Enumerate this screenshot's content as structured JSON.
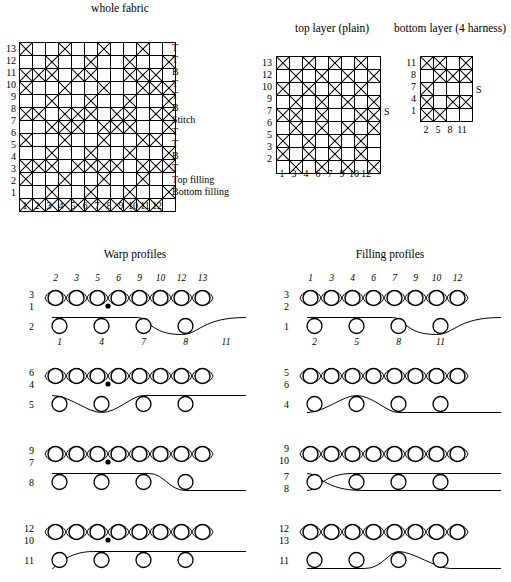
{
  "titles": {
    "whole_fabric": "whole fabric",
    "top_layer": "top layer (plain)",
    "bottom_layer": "bottom layer (4 harness)",
    "warp_profiles": "Warp profiles",
    "filling_profiles": "Filling profiles"
  },
  "whole_fabric": {
    "row_labels": [
      "13",
      "12",
      "11",
      "10",
      "9",
      "8",
      "7",
      "6",
      "5",
      "4",
      "3",
      "2",
      "1"
    ],
    "col_labels": [
      "1",
      "2",
      "3",
      "4",
      "5",
      "6",
      "7",
      "8",
      "9",
      "10",
      "11",
      "12"
    ],
    "side_codes": [
      "T",
      "T",
      "B",
      "T",
      "T",
      "B",
      "Stitch",
      "T",
      "T",
      "B",
      "T",
      "Top filling",
      "Bottom filling"
    ],
    "rows": [
      [
        1,
        0,
        0,
        1,
        0,
        0,
        1,
        0,
        0,
        1,
        0,
        0
      ],
      [
        0,
        0,
        1,
        0,
        0,
        1,
        0,
        0,
        1,
        0,
        0,
        1
      ],
      [
        1,
        1,
        1,
        0,
        1,
        1,
        0,
        0,
        1,
        1,
        1,
        0
      ],
      [
        1,
        0,
        0,
        1,
        0,
        0,
        1,
        0,
        0,
        1,
        1,
        1
      ],
      [
        0,
        0,
        1,
        0,
        0,
        1,
        0,
        0,
        1,
        0,
        0,
        1
      ],
      [
        1,
        1,
        0,
        1,
        1,
        1,
        0,
        1,
        1,
        0,
        1,
        1
      ],
      [
        0,
        0,
        1,
        1,
        1,
        0,
        1,
        1,
        1,
        0,
        0,
        1
      ],
      [
        1,
        0,
        0,
        1,
        0,
        0,
        1,
        0,
        0,
        1,
        1,
        0
      ],
      [
        0,
        0,
        1,
        0,
        0,
        1,
        0,
        0,
        1,
        0,
        0,
        1
      ],
      [
        1,
        1,
        1,
        0,
        1,
        1,
        1,
        1,
        0,
        1,
        1,
        1
      ],
      [
        1,
        0,
        0,
        1,
        0,
        0,
        1,
        0,
        0,
        1,
        0,
        0
      ],
      [
        0,
        0,
        1,
        0,
        0,
        1,
        0,
        0,
        1,
        0,
        0,
        1
      ],
      [
        1,
        1,
        1,
        1,
        1,
        1,
        1,
        1,
        1,
        1,
        1,
        0
      ]
    ]
  },
  "top_layer": {
    "row_labels": [
      "13",
      "12",
      "10",
      "9",
      "7",
      "6",
      "5",
      "3",
      "2"
    ],
    "col_labels": [
      "1",
      "3",
      "4",
      "6",
      "7",
      "9",
      "10",
      "12"
    ],
    "stitch_mark": "S",
    "rows": [
      [
        1,
        0,
        1,
        0,
        1,
        0,
        1,
        0
      ],
      [
        0,
        1,
        0,
        1,
        0,
        1,
        0,
        1
      ],
      [
        1,
        0,
        1,
        0,
        1,
        0,
        1,
        0
      ],
      [
        0,
        1,
        0,
        1,
        0,
        1,
        0,
        1
      ],
      [
        1,
        1,
        0,
        1,
        0,
        0,
        1,
        1
      ],
      [
        0,
        1,
        0,
        1,
        0,
        1,
        0,
        1
      ],
      [
        1,
        0,
        1,
        0,
        1,
        0,
        1,
        0
      ],
      [
        1,
        0,
        1,
        0,
        1,
        0,
        1,
        0
      ],
      [
        0,
        1,
        0,
        1,
        0,
        1,
        0,
        1
      ]
    ]
  },
  "bottom_layer": {
    "row_labels": [
      "11",
      "8",
      "7",
      "4",
      "1"
    ],
    "col_labels": [
      "2",
      "5",
      "8",
      "11"
    ],
    "stitch_mark": "S",
    "rows": [
      [
        1,
        1,
        0,
        1
      ],
      [
        0,
        1,
        1,
        1
      ],
      [
        1,
        0,
        0,
        0
      ],
      [
        1,
        0,
        1,
        1
      ],
      [
        1,
        1,
        0,
        0
      ]
    ]
  },
  "warp_profiles": [
    {
      "top_labels": [
        "2",
        "3",
        "5",
        "6",
        "9",
        "10",
        "12",
        "13"
      ],
      "bottom_labels": [
        "1",
        "4",
        "7",
        "8",
        "11"
      ],
      "left_labels": [
        "3",
        "1",
        "2"
      ],
      "has_stitch_dot": true,
      "dot_index": 2,
      "lower_shape": "rise-right"
    },
    {
      "top_labels": [],
      "bottom_labels": [],
      "left_labels": [
        "6",
        "4",
        "5"
      ],
      "has_stitch_dot": true,
      "dot_index": 2,
      "lower_shape": "dip-mid"
    },
    {
      "top_labels": [],
      "bottom_labels": [],
      "left_labels": [
        "9",
        "7",
        "8"
      ],
      "has_stitch_dot": true,
      "dot_index": 2,
      "lower_shape": "fall-right"
    },
    {
      "top_labels": [],
      "bottom_labels": [],
      "left_labels": [
        "12",
        "10",
        "11"
      ],
      "has_stitch_dot": true,
      "dot_index": 2,
      "lower_shape": "rise-left"
    }
  ],
  "filling_profiles": [
    {
      "top_labels": [
        "1",
        "3",
        "4",
        "6",
        "7",
        "9",
        "10",
        "12"
      ],
      "bottom_labels": [
        "2",
        "5",
        "8",
        "11"
      ],
      "left_labels": [
        "3",
        "2",
        "1"
      ],
      "has_stitch_dot": false,
      "lower_shape": "rise-right"
    },
    {
      "top_labels": [],
      "bottom_labels": [],
      "left_labels": [
        "5",
        "6",
        "4"
      ],
      "has_stitch_dot": false,
      "lower_shape": "hump-left"
    },
    {
      "top_labels": [],
      "bottom_labels": [],
      "left_labels": [
        "9",
        "10",
        "7",
        "8"
      ],
      "has_stitch_dot": false,
      "lower_shape": "cross-left"
    },
    {
      "top_labels": [],
      "bottom_labels": [],
      "left_labels": [
        "12",
        "13",
        "11"
      ],
      "has_stitch_dot": false,
      "lower_shape": "hump-right"
    }
  ],
  "colors": {
    "ink": "#000000",
    "paper": "#ffffff"
  }
}
